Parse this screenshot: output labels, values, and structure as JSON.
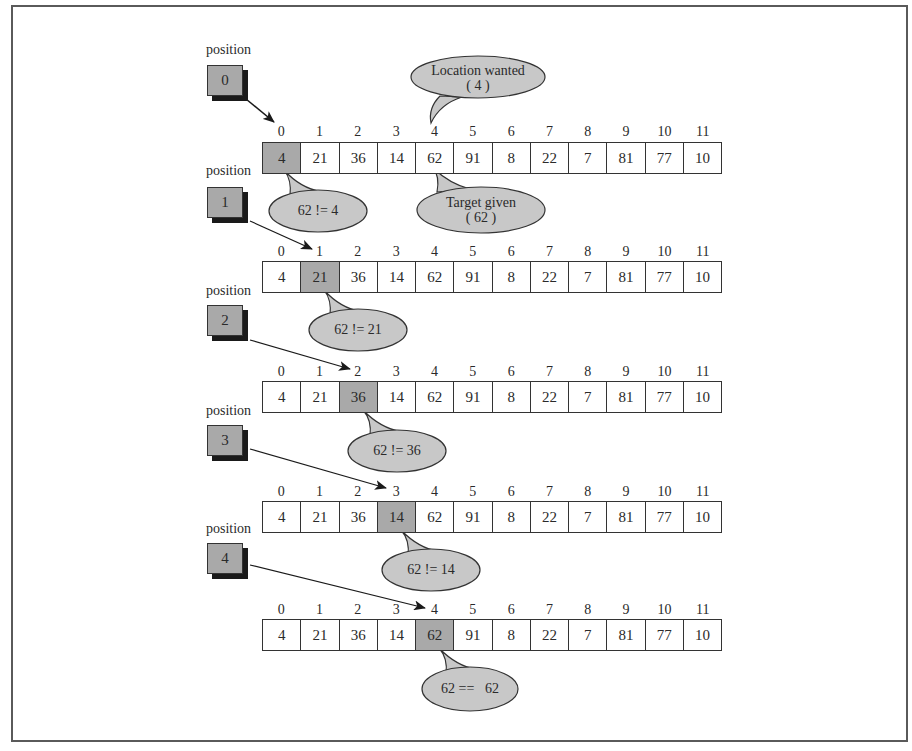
{
  "figure": {
    "position_label": "position",
    "indices": [
      "0",
      "1",
      "2",
      "3",
      "4",
      "5",
      "6",
      "7",
      "8",
      "9",
      "10",
      "11"
    ],
    "array_values": [
      "4",
      "21",
      "36",
      "14",
      "62",
      "91",
      "8",
      "22",
      "7",
      "81",
      "77",
      "10"
    ],
    "colors": {
      "highlight": "#a9a9a9",
      "bubble": "#c8c8c8",
      "line": "#333333",
      "shadow": "#1a1a1a"
    }
  },
  "steps": [
    {
      "position": "0",
      "highlight_index": 0,
      "comparison": "62 != 4"
    },
    {
      "position": "1",
      "highlight_index": 1,
      "comparison": "62 != 21"
    },
    {
      "position": "2",
      "highlight_index": 2,
      "comparison": "62 != 36"
    },
    {
      "position": "3",
      "highlight_index": 3,
      "comparison": "62 != 14"
    },
    {
      "position": "4",
      "highlight_index": 4,
      "comparison": "62 ==   62"
    }
  ],
  "callouts": {
    "location_wanted": {
      "line1": "Location wanted",
      "line2": "( 4 )"
    },
    "target_given": {
      "line1": "Target given",
      "line2": "( 62 )"
    }
  }
}
